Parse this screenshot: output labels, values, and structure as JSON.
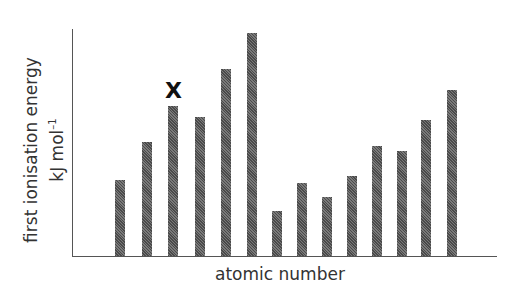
{
  "chart_data": {
    "type": "bar",
    "title": "",
    "xlabel": "atomic number",
    "ylabel": "first ionisation energy",
    "ylabel_units": "kJ mol",
    "ylabel_units_sup": "–1",
    "categories": [
      "1",
      "2",
      "3",
      "4",
      "5",
      "6",
      "7",
      "8",
      "9",
      "10",
      "11",
      "12",
      "13",
      "14"
    ],
    "values": [
      76,
      114,
      150,
      139,
      187,
      223,
      45,
      73,
      59,
      80,
      110,
      105,
      136,
      166
    ],
    "value_scale_note": "relative heights in pixels above baseline; no numeric ticks shown",
    "annotations": [
      {
        "label": "X",
        "category_index": 2
      }
    ],
    "grid": false,
    "legend": null,
    "bar_color": "#5a5a5a"
  },
  "layout": {
    "bar_lefts": [
      115,
      142,
      168,
      195,
      221,
      247,
      272,
      297,
      322,
      347,
      372,
      397,
      421,
      447
    ]
  }
}
